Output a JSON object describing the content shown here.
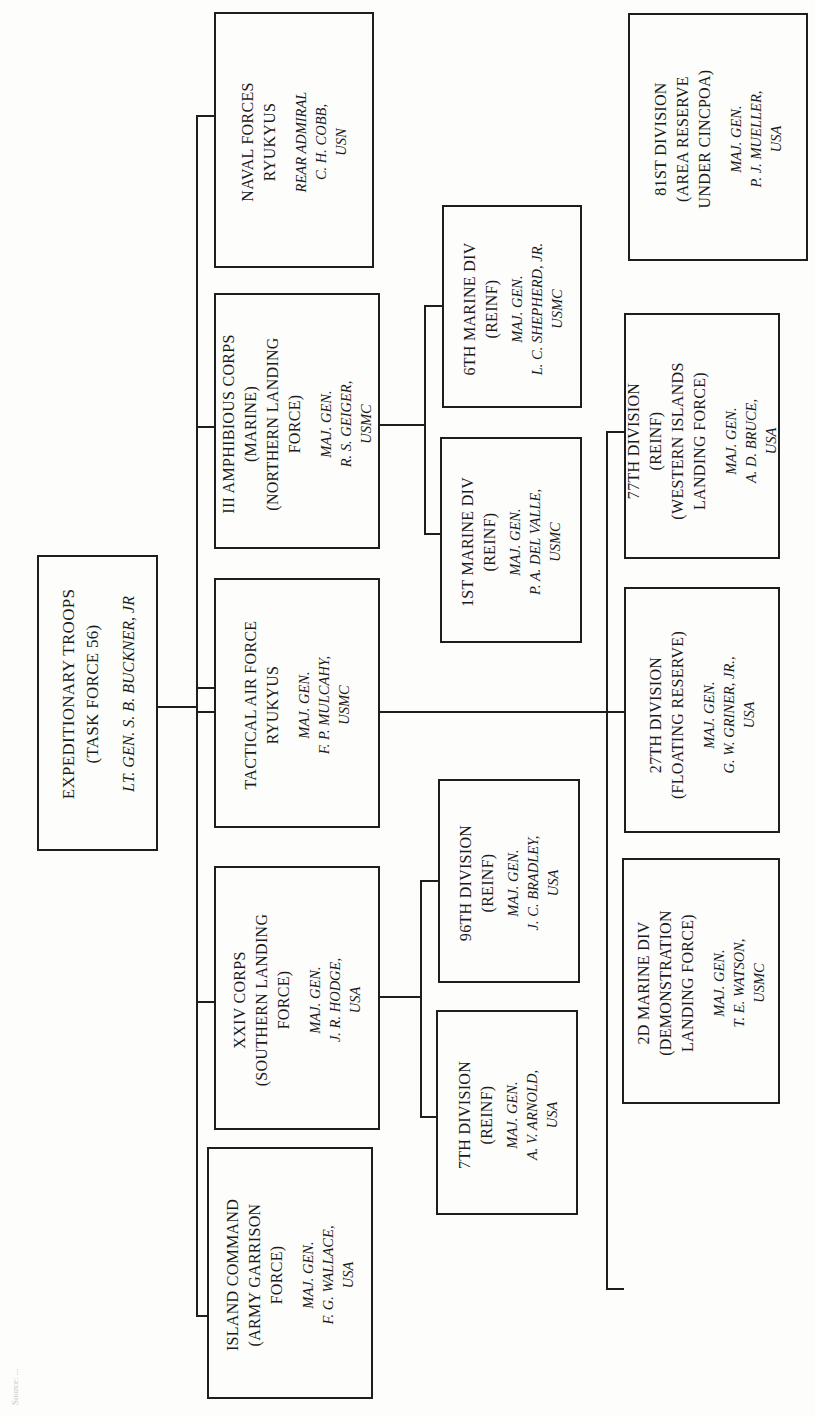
{
  "title": "January 1945",
  "root": {
    "unit": [
      "EXPEDITIONARY TROOPS",
      "(TASK FORCE 56)"
    ],
    "commander": [
      "LT. GEN. S. B. BUCKNER, JR"
    ]
  },
  "level1": [
    {
      "id": "naval",
      "unit": [
        "NAVAL FORCES",
        "RYUKYUS"
      ],
      "commander": [
        "REAR ADMIRAL",
        "C. H. COBB,",
        "USN"
      ]
    },
    {
      "id": "iiiac",
      "unit": [
        "III AMPHIBIOUS CORPS",
        "(MARINE)",
        "(NORTHERN LANDING",
        "FORCE)"
      ],
      "commander": [
        "MAJ. GEN.",
        "R. S. GEIGER,",
        "USMC"
      ]
    },
    {
      "id": "taf",
      "unit": [
        "TACTICAL AIR FORCE",
        "RYUKYUS"
      ],
      "commander": [
        "MAJ. GEN.",
        "F. P. MULCAHY,",
        "USMC"
      ]
    },
    {
      "id": "xxiv",
      "unit": [
        "XXIV CORPS",
        "(SOUTHERN LANDING",
        "FORCE)"
      ],
      "commander": [
        "MAJ. GEN.",
        "J. R. HODGE,",
        "USA"
      ]
    },
    {
      "id": "island",
      "unit": [
        "ISLAND COMMAND",
        "(ARMY GARRISON",
        "FORCE)"
      ],
      "commander": [
        "MAJ. GEN.",
        "F. G. WALLACE,",
        "USA"
      ]
    }
  ],
  "level2": [
    {
      "id": "6mar",
      "parent": "iiiac",
      "unit": [
        "6TH MARINE DIV",
        "(REINF)"
      ],
      "commander": [
        "MAJ. GEN.",
        "L. C. SHEPHERD, JR.",
        "USMC"
      ]
    },
    {
      "id": "1mar",
      "parent": "iiiac",
      "unit": [
        "1ST MARINE DIV",
        "(REINF)"
      ],
      "commander": [
        "MAJ. GEN.",
        "P. A. DEL VALLE,",
        "USMC"
      ]
    },
    {
      "id": "96div",
      "parent": "xxiv",
      "unit": [
        "96TH DIVISION",
        "(REINF)"
      ],
      "commander": [
        "MAJ. GEN.",
        "J. C. BRADLEY,",
        "USA"
      ]
    },
    {
      "id": "7div",
      "parent": "xxiv",
      "unit": [
        "7TH DIVISION",
        "(REINF)"
      ],
      "commander": [
        "MAJ. GEN.",
        "A. V. ARNOLD,",
        "USA"
      ]
    }
  ],
  "level3": [
    {
      "id": "77div",
      "parent": "root",
      "unit": [
        "77TH DIVISION",
        "(REINF)",
        "(WESTERN ISLANDS",
        "LANDING FORCE)"
      ],
      "commander": [
        "MAJ. GEN.",
        "A. D. BRUCE,",
        "USA"
      ]
    },
    {
      "id": "27div",
      "parent": "root",
      "unit": [
        "27TH DIVISION",
        "(FLOATING RESERVE)"
      ],
      "commander": [
        "MAJ. GEN.",
        "G. W. GRINER, JR.,",
        "USA"
      ]
    },
    {
      "id": "2mar",
      "parent": "root",
      "unit": [
        "2D MARINE DIV",
        "(DEMONSTRATION",
        "LANDING FORCE)"
      ],
      "commander": [
        "MAJ. GEN.",
        "T. E. WATSON,",
        "USMC"
      ]
    }
  ],
  "detached": [
    {
      "id": "81div",
      "unit": [
        "81ST DIVISION",
        "(AREA RESERVE",
        "UNDER CINCPOA)"
      ],
      "commander": [
        "MAJ. GEN.",
        "P. J. MUELLER,",
        "USA"
      ]
    }
  ],
  "footnote": "Source: ..."
}
